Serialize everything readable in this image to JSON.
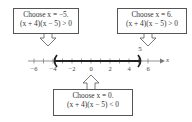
{
  "number_line": {
    "variable": "x",
    "ticks": [
      "−6",
      "−4",
      "−2",
      "0",
      "2",
      "4",
      "6"
    ],
    "tick_values": [
      -6,
      -4,
      -2,
      0,
      2,
      4,
      6
    ],
    "interval": {
      "left": -4,
      "right": 5,
      "left_bracket": "(",
      "right_bracket": ")"
    },
    "endpoint_label": "5"
  },
  "boxes": {
    "left": {
      "line1": "Choose x = −5.",
      "line2": "(x + 4)(x − 5) > 0"
    },
    "right": {
      "line1": "Choose x = 6.",
      "line2": "(x + 4)(x − 5) > 0"
    },
    "bottom": {
      "line1": "Choose x = 0.",
      "line2": "(x + 4)(x − 5) < 0"
    }
  },
  "colors": {
    "line": "#333333",
    "interval": "#222222",
    "border": "#555555"
  }
}
